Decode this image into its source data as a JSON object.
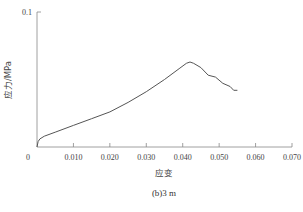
{
  "chart_data": {
    "type": "line",
    "title": "",
    "caption": "(b)3 m",
    "xlabel": "应变",
    "ylabel": "应力/MPa",
    "xlim": [
      0,
      0.07
    ],
    "ylim": [
      0,
      0.1
    ],
    "x_ticks": [
      "0",
      "0.010",
      "0.020",
      "0.030",
      "0.040",
      "0.050",
      "0.060",
      "0.070"
    ],
    "y_ticks": [
      "0",
      "0.1"
    ],
    "grid": false,
    "legend": null,
    "series": [
      {
        "name": "3 m",
        "color": "#555555",
        "x": [
          0.0,
          0.0003,
          0.0008,
          0.002,
          0.005,
          0.01,
          0.015,
          0.02,
          0.025,
          0.03,
          0.035,
          0.039,
          0.041,
          0.042,
          0.043,
          0.045,
          0.047,
          0.049,
          0.051,
          0.053,
          0.054,
          0.055
        ],
        "y": [
          0.0,
          0.004,
          0.006,
          0.008,
          0.011,
          0.016,
          0.021,
          0.026,
          0.033,
          0.041,
          0.05,
          0.058,
          0.062,
          0.063,
          0.062,
          0.058,
          0.054,
          0.051,
          0.048,
          0.044,
          0.042,
          0.042
        ]
      }
    ]
  }
}
